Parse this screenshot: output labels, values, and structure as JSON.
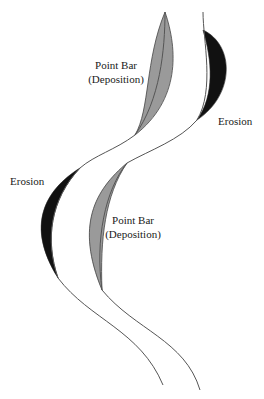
{
  "diagram": {
    "labels": {
      "point_bar_top": {
        "line1": "Point Bar",
        "line2": "(Deposition)"
      },
      "erosion_right": "Erosion",
      "erosion_left": "Erosion",
      "point_bar_bottom": {
        "line1": "Point Bar",
        "line2": "(Deposition)"
      }
    },
    "colors": {
      "deposition_fill": "#9a9a9a",
      "erosion_fill": "#111111",
      "bank_line": "#555555",
      "background": "#ffffff"
    }
  }
}
